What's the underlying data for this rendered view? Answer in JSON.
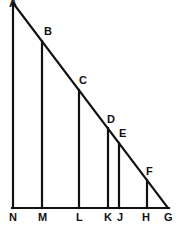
{
  "figure": {
    "background_color": "#ffffff",
    "stroke_color": "#111111",
    "label_color": "#111111",
    "canvas": {
      "width": 181,
      "height": 244
    },
    "apex": {
      "label": "A",
      "x": 13,
      "y": 3
    },
    "right_angle_vertex": {
      "label": "N",
      "x": 13,
      "y": 208
    },
    "far_vertex": {
      "label": "G",
      "x": 168,
      "y": 208
    },
    "hypotenuse": {
      "from": "A",
      "to": "G"
    },
    "base": {
      "from": "N",
      "to": "G"
    },
    "left_leg": {
      "from": "A",
      "to": "N"
    },
    "vertical_segments": [
      {
        "top_label": "B",
        "bottom_label": "M",
        "x": 42,
        "top_y": 41,
        "bottom_y": 208
      },
      {
        "top_label": "C",
        "bottom_label": "L",
        "x": 79,
        "top_y": 90,
        "bottom_y": 208
      },
      {
        "top_label": "D",
        "bottom_label": "K",
        "x": 108,
        "top_y": 128,
        "bottom_y": 208
      },
      {
        "top_label": "E",
        "bottom_label": "J",
        "x": 119,
        "top_y": 143,
        "bottom_y": 208
      },
      {
        "top_label": "F",
        "bottom_label": "H",
        "x": 147,
        "top_y": 180,
        "bottom_y": 208
      }
    ],
    "vertex_labels": [
      {
        "text": "A",
        "x": 9,
        "y": -2
      },
      {
        "text": "B",
        "x": 44,
        "y": 26
      },
      {
        "text": "C",
        "x": 79,
        "y": 75
      },
      {
        "text": "D",
        "x": 107,
        "y": 114
      },
      {
        "text": "E",
        "x": 119,
        "y": 128
      },
      {
        "text": "F",
        "x": 146,
        "y": 166
      }
    ],
    "base_labels": [
      {
        "text": "N",
        "x": 9,
        "y": 212
      },
      {
        "text": "M",
        "x": 38,
        "y": 212
      },
      {
        "text": "L",
        "x": 76,
        "y": 212
      },
      {
        "text": "K",
        "x": 104,
        "y": 212
      },
      {
        "text": "J",
        "x": 117,
        "y": 212
      },
      {
        "text": "H",
        "x": 142,
        "y": 212
      },
      {
        "text": "G",
        "x": 164,
        "y": 212
      }
    ]
  }
}
